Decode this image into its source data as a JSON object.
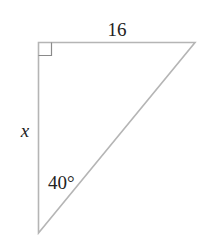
{
  "diagram": {
    "type": "right-triangle",
    "vertices": {
      "right_angle": [
        38.5,
        42.5
      ],
      "top_right": [
        195,
        42.5
      ],
      "bottom": [
        38.5,
        233
      ]
    },
    "labels": {
      "top_side": "16",
      "left_side": "x",
      "bottom_angle": "40°"
    },
    "colors": {
      "stroke": "#b5b5b5",
      "text": "#222222",
      "background": "#ffffff"
    }
  }
}
